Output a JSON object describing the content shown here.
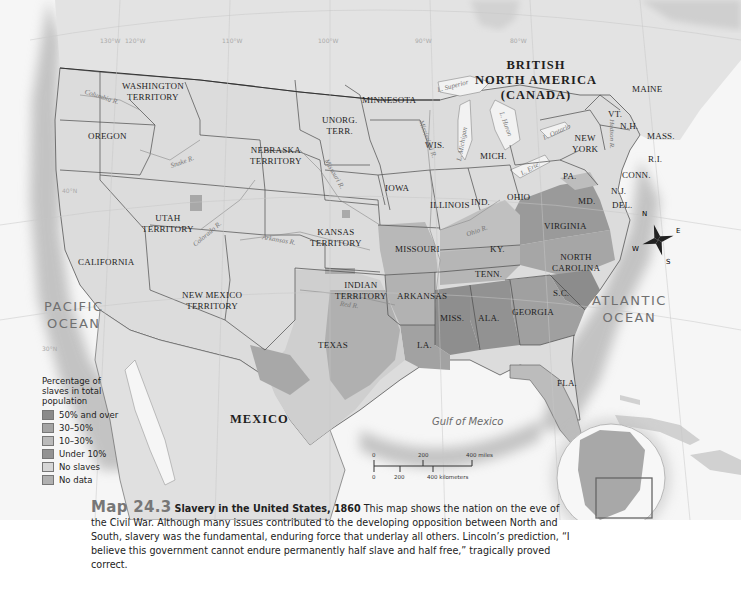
{
  "map": {
    "title_number": "Map 24.3",
    "title": "Slavery in the United States, 1860",
    "caption_text": "This map shows the nation on the eve of the Civil War. Although many issues contributed to the developing opposition between North and South, slavery was the fundamental, enduring force that underlay all others. Lincoln’s prediction, “I believe this government cannot endure permanently half slave and half free,” tragically proved correct.",
    "countries": {
      "canada_line1": "BRITISH",
      "canada_line2": "NORTH AMERICA",
      "canada_line3": "(CANADA)",
      "mexico": "MEXICO"
    },
    "oceans": {
      "pacific_line1": "PACIFIC",
      "pacific_line2": "OCEAN",
      "atlantic_line1": "ATLANTIC",
      "atlantic_line2": "OCEAN",
      "gulf": "Gulf of Mexico"
    },
    "states": {
      "washington_1": "WASHINGTON",
      "washington_2": "TERRITORY",
      "oregon": "OREGON",
      "california": "CALIFORNIA",
      "utah_1": "UTAH",
      "utah_2": "TERRITORY",
      "nebraska_1": "NEBRASKA",
      "nebraska_2": "TERRITORY",
      "unorg_1": "UNORG.",
      "unorg_2": "TERR.",
      "minnesota": "MINNESOTA",
      "kansas_1": "KANSAS",
      "kansas_2": "TERRITORY",
      "newmexico_1": "NEW MEXICO",
      "newmexico_2": "TERRITORY",
      "indian_1": "INDIAN",
      "indian_2": "TERRITORY",
      "texas": "TEXAS",
      "iowa": "IOWA",
      "missouri": "MISSOURI",
      "arkansas": "ARKANSAS",
      "la": "LA.",
      "wis": "WIS.",
      "illinois": "ILLINOIS",
      "mich": "MICH.",
      "ind": "IND.",
      "ohio": "OHIO",
      "ky": "KY.",
      "tenn": "TENN.",
      "miss": "MISS.",
      "ala": "ALA.",
      "georgia": "GEORGIA",
      "fla": "FLA.",
      "sc": "S.C.",
      "nc_1": "NORTH",
      "nc_2": "CAROLINA",
      "virginia": "VIRGINIA",
      "pa": "PA.",
      "newyork_1": "NEW",
      "newyork_2": "YORK",
      "nj": "N.J.",
      "md": "MD.",
      "del": "DEL.",
      "conn": "CONN.",
      "ri": "R.I.",
      "mass": "MASS.",
      "vt": "VT.",
      "nh": "N.H.",
      "maine": "MAINE"
    },
    "water": {
      "columbia": "Columbia R.",
      "snake": "Snake R.",
      "missouri_r": "Missouri R.",
      "mississippi": "Mississippi R.",
      "colorado": "Colorado R.",
      "arkansas_r": "Arkansas R.",
      "red": "Red R.",
      "ohio_r": "Ohio R.",
      "superior": "L. Superior",
      "michigan": "L. Michigan",
      "huron": "L. Huron",
      "erie": "L. Erie",
      "ontario": "L. Ontario",
      "hudson": "Hudson R."
    },
    "graticule": [
      "120°W",
      "130°W",
      "110°W",
      "100°W",
      "90°W",
      "80°W",
      "70°W",
      "40°N",
      "30°N"
    ],
    "compass": {
      "n": "N",
      "s": "S",
      "e": "E",
      "w": "W"
    },
    "scale": {
      "miles_0": "0",
      "miles_200": "200",
      "miles_400": "400 miles",
      "km_0": "0",
      "km_200": "200",
      "km_400": "400 kilometers"
    },
    "legend": {
      "title": "Percentage of slaves in total population",
      "items": [
        {
          "label": "50% and over",
          "color": "#8a8a8a"
        },
        {
          "label": "30–50%",
          "color": "#a4a4a4"
        },
        {
          "label": "10–30%",
          "color": "#bababa"
        },
        {
          "label": "Under 10%",
          "color": "#939393"
        },
        {
          "label": "No slaves",
          "color": "#d6d6d6"
        },
        {
          "label": "No data",
          "color": "#b0b0b0"
        }
      ]
    },
    "colors": {
      "water": "#f5f5f5",
      "land_free": "#d8d8d8",
      "land_foreign": "#e2e2e2",
      "slave_high": "#8a8a8a",
      "slave_mid": "#a4a4a4",
      "slave_low": "#bababa",
      "border": "#3a3a3a"
    }
  }
}
